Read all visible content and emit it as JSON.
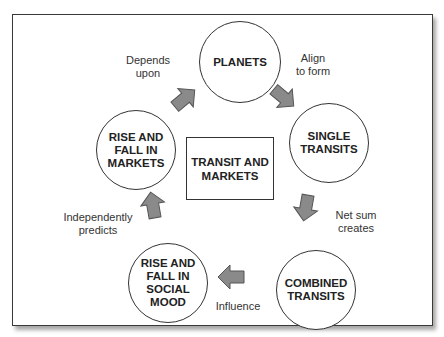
{
  "diagram": {
    "center": {
      "label": "TRANSIT AND\nMARKETS"
    },
    "nodes": [
      {
        "id": "planets",
        "label": "PLANETS"
      },
      {
        "id": "single-transits",
        "label": "SINGLE\nTRANSITS"
      },
      {
        "id": "combined-transits",
        "label": "COMBINED\nTRANSITS"
      },
      {
        "id": "social-mood",
        "label": "RISE AND\nFALL IN\nSOCIAL\nMOOD"
      },
      {
        "id": "markets",
        "label": "RISE AND\nFALL IN\nMARKETS"
      }
    ],
    "edges": [
      {
        "from": "planets",
        "to": "single-transits",
        "label": "Align\nto form"
      },
      {
        "from": "single-transits",
        "to": "combined-transits",
        "label": "Net sum\ncreates"
      },
      {
        "from": "combined-transits",
        "to": "social-mood",
        "label": "Influence"
      },
      {
        "from": "social-mood",
        "to": "markets",
        "label": "Independently\npredicts"
      },
      {
        "from": "markets",
        "to": "planets",
        "label": "Depends\nupon"
      }
    ],
    "colors": {
      "arrow_fill": "#8a8a8a",
      "arrow_stroke": "#555555",
      "border": "#333333"
    }
  }
}
